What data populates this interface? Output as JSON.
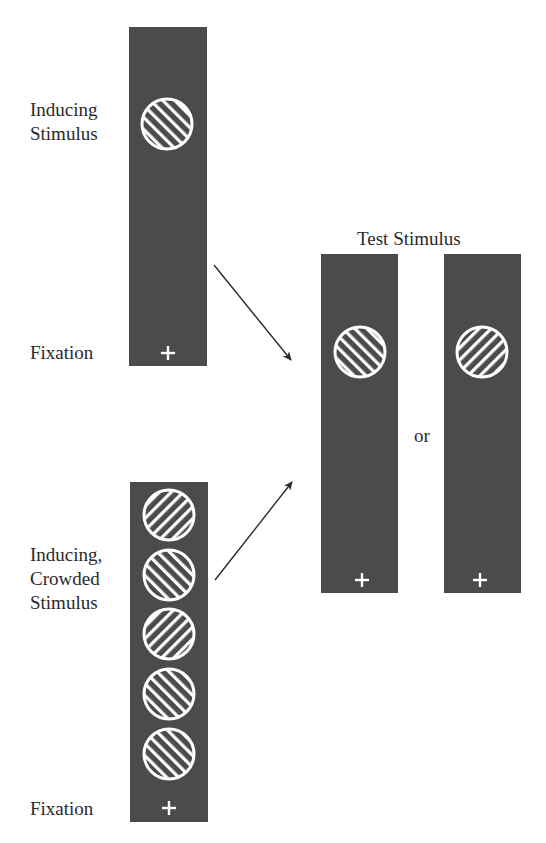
{
  "figure": {
    "colors": {
      "background": "#ffffff",
      "panel": "#4b4b4b",
      "stimulus": "#ffffff",
      "arrow": "#2a2a2a",
      "text": "#2a2a2a"
    },
    "top_group": {
      "label_line1": "Inducing",
      "label_line2": "Stimulus",
      "fixation_label": "Fixation",
      "stimuli": [
        {
          "orientation": "right-tilt",
          "stripe_angle": -45
        }
      ],
      "fixation_symbol": "+"
    },
    "bottom_group": {
      "label_line1": "Inducing,",
      "label_line2": "Crowded",
      "label_line3": "Stimulus",
      "fixation_label": "Fixation",
      "stimuli": [
        {
          "orientation": "left-tilt",
          "stripe_angle": 45
        },
        {
          "orientation": "right-tilt",
          "stripe_angle": -45
        },
        {
          "orientation": "left-tilt",
          "stripe_angle": 45
        },
        {
          "orientation": "right-tilt",
          "stripe_angle": -45
        },
        {
          "orientation": "right-tilt",
          "stripe_angle": -45
        }
      ],
      "fixation_symbol": "+"
    },
    "test_group": {
      "title": "Test Stimulus",
      "separator": "or",
      "options": [
        {
          "orientation": "right-tilt",
          "stripe_angle": -45,
          "fixation_symbol": "+"
        },
        {
          "orientation": "left-tilt",
          "stripe_angle": 45,
          "fixation_symbol": "+"
        }
      ]
    },
    "arrows": [
      {
        "from": "top_group",
        "to": "test_group"
      },
      {
        "from": "bottom_group",
        "to": "test_group"
      }
    ]
  }
}
